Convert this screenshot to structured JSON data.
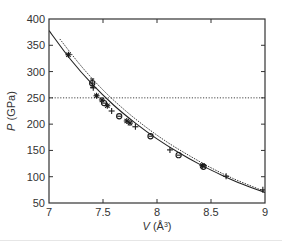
{
  "chart_data": {
    "type": "scatter",
    "title": "",
    "xlabel_var": "V",
    "xlabel_unit": " (Å",
    "xlabel_sup": "3",
    "xlabel_close": ")",
    "ylabel_var": "P",
    "ylabel_unit": " (GPa)",
    "xlim": [
      7,
      9
    ],
    "ylim": [
      50,
      400
    ],
    "x_ticks": [
      7,
      7.5,
      8,
      8.5,
      9
    ],
    "x_tick_labels": [
      "7",
      "7.5",
      "8",
      "8.5",
      "9"
    ],
    "y_ticks": [
      50,
      100,
      150,
      200,
      250,
      300,
      350,
      400
    ],
    "y_tick_labels": [
      "50",
      "100",
      "150",
      "200",
      "250",
      "300",
      "350",
      "400"
    ],
    "grid": false,
    "legend": null,
    "reference_line": {
      "orientation": "horizontal",
      "y": 250,
      "style": "dotted"
    },
    "series": [
      {
        "name": "experimental data",
        "kind": "markers",
        "points": [
          {
            "x": 7.18,
            "y": 332,
            "marker": "asterisk"
          },
          {
            "x": 7.4,
            "y": 278,
            "marker": "circle",
            "yerr": 8
          },
          {
            "x": 7.41,
            "y": 269,
            "marker": "cross"
          },
          {
            "x": 7.44,
            "y": 254,
            "marker": "asterisk"
          },
          {
            "x": 7.49,
            "y": 246,
            "marker": "asterisk"
          },
          {
            "x": 7.51,
            "y": 240,
            "marker": "circle"
          },
          {
            "x": 7.54,
            "y": 235,
            "marker": "asterisk"
          },
          {
            "x": 7.58,
            "y": 225,
            "marker": "cross"
          },
          {
            "x": 7.65,
            "y": 215,
            "marker": "circle"
          },
          {
            "x": 7.72,
            "y": 206,
            "marker": "asterisk"
          },
          {
            "x": 7.75,
            "y": 202,
            "marker": "asterisk"
          },
          {
            "x": 7.8,
            "y": 195,
            "marker": "cross"
          },
          {
            "x": 7.94,
            "y": 177,
            "marker": "circle"
          },
          {
            "x": 8.12,
            "y": 151,
            "marker": "cross"
          },
          {
            "x": 8.2,
            "y": 141,
            "marker": "circle"
          },
          {
            "x": 8.42,
            "y": 121,
            "marker": "asterisk"
          },
          {
            "x": 8.43,
            "y": 119,
            "marker": "circle"
          },
          {
            "x": 8.64,
            "y": 101,
            "marker": "cross"
          },
          {
            "x": 8.98,
            "y": 75,
            "marker": "cross"
          }
        ]
      },
      {
        "name": "fit (solid)",
        "kind": "line",
        "style": "solid",
        "x": [
          7.0,
          7.2,
          7.4,
          7.6,
          7.8,
          8.0,
          8.2,
          8.4,
          8.6,
          8.8,
          9.0
        ],
        "y": [
          378,
          323,
          276,
          236,
          202,
          172,
          146,
          123,
          103,
          85,
          70
        ]
      },
      {
        "name": "fit (dotted)",
        "kind": "line",
        "style": "dotted",
        "x": [
          7.1,
          7.3,
          7.5,
          7.7,
          7.9,
          8.1,
          8.3,
          8.5,
          8.7,
          8.9,
          9.0
        ],
        "y": [
          362,
          310,
          265,
          227,
          194,
          165,
          140,
          117,
          97,
          80,
          72
        ]
      }
    ]
  },
  "colors": {
    "axis": "#333333",
    "marker": "#1a1a1a",
    "line": "#222222",
    "reference_line": "#444444"
  }
}
